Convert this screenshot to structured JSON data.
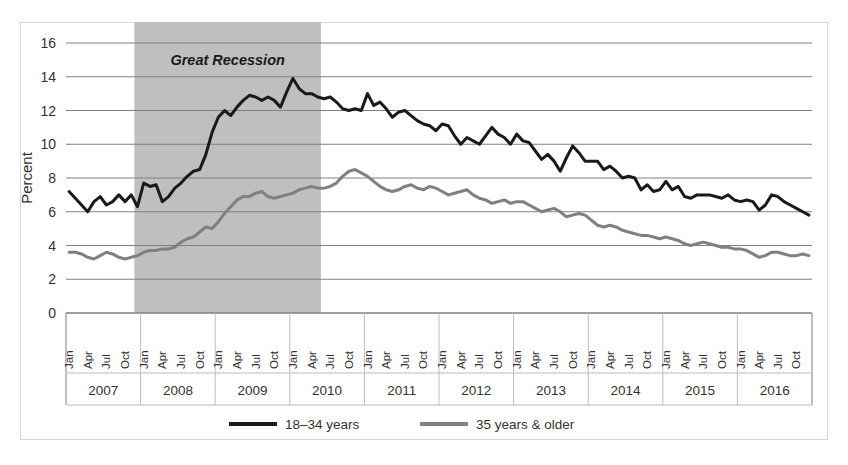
{
  "chart_data": {
    "type": "line",
    "title": "",
    "xlabel": "",
    "ylabel": "Percent",
    "ylim": [
      0,
      16
    ],
    "ytick_step": 2,
    "yticks": [
      "0",
      "2",
      "4",
      "6",
      "8",
      "10",
      "12",
      "14",
      "16"
    ],
    "grid": true,
    "legend_position": "bottom-center",
    "months_per_year": [
      "Jan",
      "Apr",
      "Jul",
      "Oct"
    ],
    "years": [
      "2007",
      "2008",
      "2009",
      "2010",
      "2011",
      "2012",
      "2013",
      "2014",
      "2015",
      "2016"
    ],
    "annotations": [
      {
        "text": "Great Recession",
        "type": "shaded-band",
        "start": "2007-12",
        "end": "2010-06",
        "color": "#bfbfbf"
      }
    ],
    "series": [
      {
        "name": "18–34 years",
        "color": "#1a1a1a",
        "stroke_width": 3,
        "values": [
          7.2,
          6.8,
          6.4,
          6.0,
          6.6,
          6.9,
          6.4,
          6.6,
          7.0,
          6.6,
          7.0,
          6.3,
          7.7,
          7.5,
          7.6,
          6.6,
          6.9,
          7.4,
          7.7,
          8.1,
          8.4,
          8.5,
          9.4,
          10.7,
          11.6,
          12.0,
          11.7,
          12.2,
          12.6,
          12.9,
          12.8,
          12.6,
          12.8,
          12.6,
          12.2,
          13.1,
          13.9,
          13.3,
          13.0,
          13.0,
          12.8,
          12.7,
          12.8,
          12.5,
          12.1,
          12.0,
          12.1,
          12.0,
          13.0,
          12.3,
          12.5,
          12.1,
          11.6,
          11.9,
          12.0,
          11.7,
          11.4,
          11.2,
          11.1,
          10.8,
          11.2,
          11.1,
          10.5,
          10.0,
          10.4,
          10.2,
          10.0,
          10.5,
          11.0,
          10.6,
          10.4,
          10.0,
          10.6,
          10.2,
          10.1,
          9.6,
          9.1,
          9.4,
          9.0,
          8.4,
          9.2,
          9.9,
          9.5,
          9.0,
          9.0,
          9.0,
          8.5,
          8.7,
          8.4,
          8.0,
          8.1,
          8.0,
          7.3,
          7.6,
          7.2,
          7.3,
          7.8,
          7.3,
          7.5,
          6.9,
          6.8,
          7.0,
          7.0,
          7.0,
          6.9,
          6.8,
          7.0,
          6.7,
          6.6,
          6.7,
          6.6,
          6.1,
          6.4,
          7.0,
          6.9,
          6.6,
          6.4,
          6.2,
          6.0,
          5.8
        ]
      },
      {
        "name": "35 years & older",
        "color": "#808080",
        "stroke_width": 3,
        "values": [
          3.6,
          3.6,
          3.5,
          3.3,
          3.2,
          3.4,
          3.6,
          3.5,
          3.3,
          3.2,
          3.3,
          3.4,
          3.6,
          3.7,
          3.7,
          3.8,
          3.8,
          3.9,
          4.2,
          4.4,
          4.5,
          4.8,
          5.1,
          5.0,
          5.4,
          5.9,
          6.3,
          6.7,
          6.9,
          6.9,
          7.1,
          7.2,
          6.9,
          6.8,
          6.9,
          7.0,
          7.1,
          7.3,
          7.4,
          7.5,
          7.4,
          7.4,
          7.5,
          7.7,
          8.1,
          8.4,
          8.5,
          8.3,
          8.1,
          7.8,
          7.5,
          7.3,
          7.2,
          7.3,
          7.5,
          7.6,
          7.4,
          7.3,
          7.5,
          7.4,
          7.2,
          7.0,
          7.1,
          7.2,
          7.3,
          7.0,
          6.8,
          6.7,
          6.5,
          6.6,
          6.7,
          6.5,
          6.6,
          6.6,
          6.4,
          6.2,
          6.0,
          6.1,
          6.2,
          6.0,
          5.7,
          5.8,
          5.9,
          5.8,
          5.5,
          5.2,
          5.1,
          5.2,
          5.1,
          4.9,
          4.8,
          4.7,
          4.6,
          4.6,
          4.5,
          4.4,
          4.5,
          4.4,
          4.3,
          4.1,
          4.0,
          4.1,
          4.2,
          4.1,
          4.0,
          3.9,
          3.9,
          3.8,
          3.8,
          3.7,
          3.5,
          3.3,
          3.4,
          3.6,
          3.6,
          3.5,
          3.4,
          3.4,
          3.5,
          3.4
        ]
      }
    ]
  },
  "legend": {
    "items": [
      {
        "label": "18–34 years",
        "color": "#1a1a1a"
      },
      {
        "label": "35 years & older",
        "color": "#808080"
      }
    ]
  },
  "axes": {
    "y_title": "Percent"
  }
}
